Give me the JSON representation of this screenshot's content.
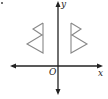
{
  "diagram": {
    "type": "coordinate-plane-reflection",
    "axes": {
      "x_label": "x",
      "y_label": "y",
      "origin_label": "O"
    },
    "shapes": [
      {
        "name": "left-figure",
        "description": "double-triangle shape left of y-axis"
      },
      {
        "name": "right-figure",
        "description": "double-triangle shape right of y-axis, mirror image across y-axis"
      }
    ],
    "colors": {
      "axes": "#222222",
      "shapes": "#888888",
      "background": "#ffffff"
    }
  }
}
